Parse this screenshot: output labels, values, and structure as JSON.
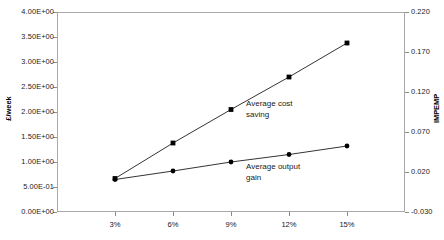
{
  "chart_data": {
    "type": "line",
    "title": "",
    "xlabel": "",
    "ylabel": "£/week",
    "y2label": "IMPEMP",
    "grid": false,
    "legend": "inline-annotations",
    "categories": [
      "3%",
      "6%",
      "9%",
      "12%",
      "15%"
    ],
    "ylim": [
      0,
      4
    ],
    "yticks": [
      "0.00E+00",
      "5.00E-01",
      "1.00E+00",
      "1.50E+00",
      "2.00E+00",
      "2.50E+00",
      "3.00E+00",
      "3.50E+00",
      "4.00E+00"
    ],
    "ytick_values": [
      0,
      0.5,
      1,
      1.5,
      2,
      2.5,
      3,
      3.5,
      4
    ],
    "y2lim": [
      -0.03,
      0.22
    ],
    "y2ticks": [
      "-0.030",
      "0.020",
      "0.070",
      "0.120",
      "0.170",
      "0.220"
    ],
    "y2tick_values": [
      -0.03,
      0.02,
      0.07,
      0.12,
      0.17,
      0.22
    ],
    "series": [
      {
        "name": "Average cost saving",
        "axis": "left",
        "marker": "square",
        "color": "#000000",
        "values": [
          0.67,
          1.38,
          2.05,
          2.7,
          3.38
        ]
      },
      {
        "name": "Average output gain",
        "axis": "left",
        "marker": "circle",
        "color": "#000000",
        "values": [
          0.65,
          0.82,
          1.0,
          1.15,
          1.32
        ]
      }
    ],
    "annotations": [
      {
        "text": "Average cost\nsaving",
        "series": "Average cost saving"
      },
      {
        "text": "Average output\ngain",
        "series": "Average output gain"
      }
    ]
  }
}
